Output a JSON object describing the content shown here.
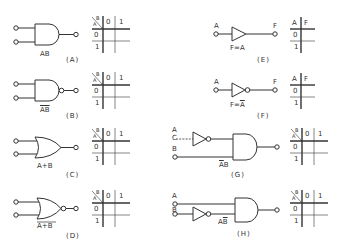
{
  "figure": {
    "panels": [
      {
        "id": "A",
        "caption": "(A)",
        "gate": "AND",
        "expression": "AB",
        "overline": false,
        "table": {
          "row_header": "A",
          "col_header": "B",
          "cols": [
            "0",
            "1"
          ],
          "rows": [
            "0",
            "1"
          ]
        }
      },
      {
        "id": "B",
        "caption": "(B)",
        "gate": "NAND",
        "expression": "AB",
        "overline": true,
        "table": {
          "row_header": "A",
          "col_header": "B",
          "cols": [
            "0",
            "1"
          ],
          "rows": [
            "0",
            "1"
          ]
        }
      },
      {
        "id": "C",
        "caption": "(C)",
        "gate": "OR",
        "expression": "A+B",
        "overline": false,
        "table": {
          "row_header": "A",
          "col_header": "B",
          "cols": [
            "0",
            "1"
          ],
          "rows": [
            "0",
            "1"
          ]
        }
      },
      {
        "id": "D",
        "caption": "(D)",
        "gate": "NOR",
        "expression": "A+B",
        "overline": true,
        "table": {
          "row_header": "A",
          "col_header": "B",
          "cols": [
            "0",
            "1"
          ],
          "rows": [
            "0",
            "1"
          ]
        }
      },
      {
        "id": "E",
        "caption": "(E)",
        "gate": "BUFFER",
        "input": "A",
        "output": "F",
        "expression": "F=A",
        "table": {
          "headers": [
            "A",
            "F"
          ],
          "rows": [
            "0",
            "1"
          ]
        }
      },
      {
        "id": "F",
        "caption": "(F)",
        "gate": "NOT",
        "input": "A",
        "output": "F",
        "expression_prefix": "F=",
        "expression_var": "A",
        "table": {
          "headers": [
            "A",
            "F"
          ],
          "rows": [
            "0",
            "1"
          ]
        }
      },
      {
        "id": "G",
        "caption": "(G)",
        "gate": "NOT-A AND B",
        "inputs": [
          "A",
          "B"
        ],
        "input_c": "C",
        "expression_neg": "A",
        "expression_pos": "B",
        "table": {
          "row_header": "A",
          "col_header": "B",
          "cols": [
            "0",
            "1"
          ],
          "rows": [
            "0",
            "1"
          ]
        }
      },
      {
        "id": "H",
        "caption": "(H)",
        "gate": "A AND NOT-B",
        "inputs": [
          "A",
          "B"
        ],
        "expression_pos": "A",
        "expression_neg": "B",
        "table": {
          "row_header": "A",
          "col_header": "B",
          "cols": [
            "0",
            "1"
          ],
          "rows": [
            "0",
            "1"
          ]
        }
      }
    ]
  },
  "colors": {
    "stroke": "#333333",
    "background": "#ffffff"
  }
}
